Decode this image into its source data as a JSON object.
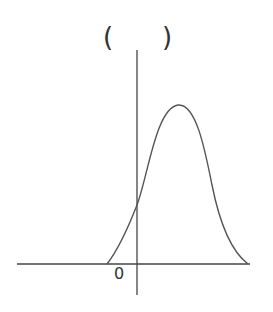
{
  "question": {
    "answer_bracket_open": "(",
    "answer_bracket_close": ")"
  },
  "graph": {
    "origin_label": "0",
    "axis_color": "#444444",
    "curve_color": "#555555",
    "curve_shape": "bell-shaped curve, zero at left then rises through positive y-intercept to a peak right of y-axis, then falls to zero"
  },
  "top_clipped": {
    "glyphs": [
      "",
      "",
      ""
    ]
  }
}
